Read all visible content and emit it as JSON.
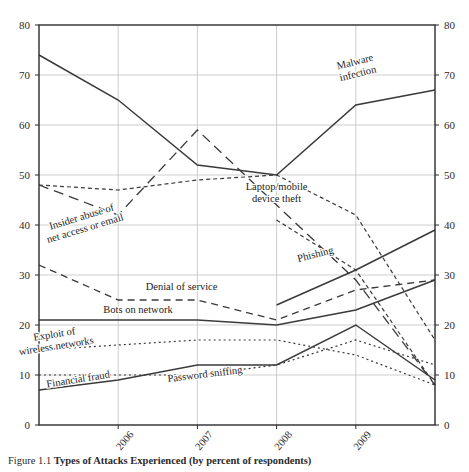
{
  "figure": {
    "caption_number": "Figure 1.1",
    "caption_text": "Types of Attacks Experienced (by percent of respondents)"
  },
  "chart_data": {
    "type": "line",
    "title": "",
    "subtitle": "",
    "xlabel": "",
    "ylabel": "",
    "ylim": [
      0,
      80
    ],
    "ytick_labels": [
      "0",
      "10",
      "20",
      "30",
      "40",
      "50",
      "60",
      "70",
      "80"
    ],
    "ytick_values": [
      0,
      10,
      20,
      30,
      40,
      50,
      60,
      70,
      80
    ],
    "y_axis_right_labels": [
      "0",
      "10",
      "20",
      "30",
      "40",
      "50",
      "60",
      "70",
      "80"
    ],
    "x": [
      2005,
      2006,
      2007,
      2008,
      2009,
      2010
    ],
    "xtick_labels": [
      "2006",
      "2007",
      "2008",
      "2009"
    ],
    "xtick_values": [
      2006,
      2007,
      2008,
      2009
    ],
    "grid": true,
    "legend_position": "inline-annotations",
    "series": [
      {
        "name": "Malware infection",
        "style": "solid",
        "values": [
          74,
          65,
          52,
          50,
          64,
          67
        ],
        "label_x": 2009.0,
        "label_y": 72,
        "label_rotation": -14,
        "label_lines": [
          "Malware",
          "infection"
        ]
      },
      {
        "name": "Insider abuse of net access or email",
        "style": "long-dash",
        "values": [
          48,
          42,
          59,
          44,
          29,
          8
        ],
        "label_x": 2005.55,
        "label_y": 41,
        "label_rotation": -17,
        "label_lines": [
          "Insider abuse of",
          "net access or email"
        ]
      },
      {
        "name": "Laptop/mobile device theft",
        "style": "short-dash",
        "values": [
          48,
          47,
          49,
          50,
          42,
          17
        ],
        "label_x": 2008.0,
        "label_y": 47,
        "label_rotation": 0,
        "label_lines": [
          "Laptop/mobile",
          "device theft"
        ]
      },
      {
        "name": "Denial of service",
        "style": "dash",
        "values": [
          32,
          25,
          25,
          21,
          27,
          29
        ],
        "label_x": 2006.8,
        "label_y": 27,
        "label_rotation": 0,
        "label_lines": [
          "Denial of service"
        ]
      },
      {
        "name": "Bots on network",
        "style": "solid",
        "values": [
          21,
          21,
          21,
          20,
          23,
          29
        ],
        "label_x": 2006.25,
        "label_y": 22.5,
        "label_rotation": 0,
        "label_lines": [
          "Bots on network"
        ]
      },
      {
        "name": "Exploit of wireless networks",
        "style": "dotted",
        "values": [
          15,
          16,
          17,
          17,
          14,
          8
        ],
        "label_x": 2005.2,
        "label_y": 17.5,
        "label_rotation": -9,
        "label_lines": [
          "Exploit of",
          "wireless networks"
        ]
      },
      {
        "name": "Financial fraud",
        "style": "solid",
        "values": [
          7,
          9,
          12,
          12,
          20,
          9
        ],
        "label_x": 2005.5,
        "label_y": 8.5,
        "label_rotation": -9,
        "label_lines": [
          "Financial fraud"
        ]
      },
      {
        "name": "Password sniffing",
        "style": "dotted",
        "values": [
          10,
          10,
          10,
          12,
          17,
          12
        ],
        "label_x": 2007.1,
        "label_y": 9.5,
        "label_rotation": -7,
        "label_lines": [
          "Password sniffing"
        ]
      },
      {
        "name": "Phishing",
        "style": "solid",
        "values": [
          null,
          null,
          null,
          24,
          31,
          39
        ],
        "label_x": 2008.5,
        "label_y": 33.5,
        "label_rotation": -14,
        "label_lines": [
          "Phishing"
        ]
      },
      {
        "name": "Phishing upper trend",
        "style": "short-dash",
        "values": [
          null,
          null,
          null,
          41,
          31,
          8
        ],
        "label_x": null,
        "label_y": null,
        "label_rotation": 0,
        "label_lines": []
      }
    ]
  }
}
